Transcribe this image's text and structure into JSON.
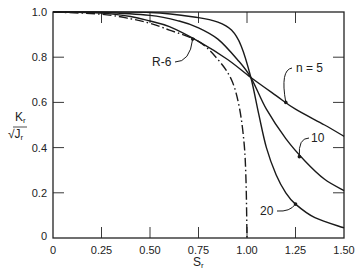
{
  "chart_data": {
    "type": "line",
    "title": "",
    "xlabel": "S_r",
    "ylabel": "K_r / √J_r",
    "xlim": [
      0,
      1.5
    ],
    "ylim": [
      0,
      1.0
    ],
    "grid": false,
    "x_ticks": [
      "0",
      "0.25",
      "0.50",
      "0.75",
      "1.00",
      "1.25",
      "1.50"
    ],
    "x_tick_values": [
      0,
      0.25,
      0.5,
      0.75,
      1.0,
      1.25,
      1.5
    ],
    "y_ticks": [
      "0",
      "0.2",
      "0.4",
      "0.6",
      "0.8",
      "1.0"
    ],
    "y_tick_values": [
      0,
      0.2,
      0.4,
      0.6,
      0.8,
      1.0
    ],
    "series": [
      {
        "name": "n = 5",
        "style": "solid",
        "x": [
          0,
          0.25,
          0.4,
          0.5,
          0.6,
          0.75,
          0.9,
          1.02,
          1.15,
          1.25,
          1.4,
          1.5
        ],
        "y": [
          1.0,
          0.995,
          0.98,
          0.96,
          0.935,
          0.87,
          0.79,
          0.71,
          0.63,
          0.57,
          0.5,
          0.45
        ]
      },
      {
        "name": "10",
        "style": "solid",
        "x": [
          0,
          0.25,
          0.5,
          0.65,
          0.75,
          0.85,
          0.95,
          1.02,
          1.1,
          1.2,
          1.3,
          1.4,
          1.5
        ],
        "y": [
          1.0,
          0.998,
          0.985,
          0.96,
          0.93,
          0.88,
          0.79,
          0.71,
          0.57,
          0.44,
          0.34,
          0.26,
          0.21
        ]
      },
      {
        "name": "20",
        "style": "solid",
        "x": [
          0,
          0.5,
          0.75,
          0.85,
          0.92,
          0.97,
          1.02,
          1.06,
          1.1,
          1.15,
          1.2,
          1.25,
          1.35,
          1.5
        ],
        "y": [
          1.0,
          0.998,
          0.975,
          0.955,
          0.92,
          0.85,
          0.71,
          0.55,
          0.4,
          0.28,
          0.2,
          0.15,
          0.09,
          0.045
        ]
      },
      {
        "name": "R-6",
        "style": "dash-dot",
        "x": [
          0,
          0.25,
          0.4,
          0.5,
          0.6,
          0.75,
          0.85,
          0.92,
          0.96,
          0.985,
          0.995,
          1.0
        ],
        "y": [
          1.0,
          0.99,
          0.97,
          0.95,
          0.92,
          0.87,
          0.79,
          0.7,
          0.58,
          0.42,
          0.25,
          0.0
        ]
      }
    ],
    "annotations": [
      {
        "text": "n = 5",
        "points_to_x": 1.2,
        "points_to_y": 0.6
      },
      {
        "text": "10",
        "points_to_x": 1.27,
        "points_to_y": 0.36
      },
      {
        "text": "20",
        "points_to_x": 1.25,
        "points_to_y": 0.15
      },
      {
        "text": "R-6",
        "points_to_x": 0.72,
        "points_to_y": 0.88
      }
    ],
    "intersection": {
      "x": 1.02,
      "y": 0.71
    }
  },
  "labels": {
    "y_axis_top": "K",
    "y_axis_top_sub": "r",
    "y_axis_bottom": "√J",
    "y_axis_bottom_sub": "r",
    "x_axis": "S",
    "x_axis_sub": "r",
    "n5": "n = 5",
    "n10": "10",
    "n20": "20",
    "r6": "R-6"
  }
}
